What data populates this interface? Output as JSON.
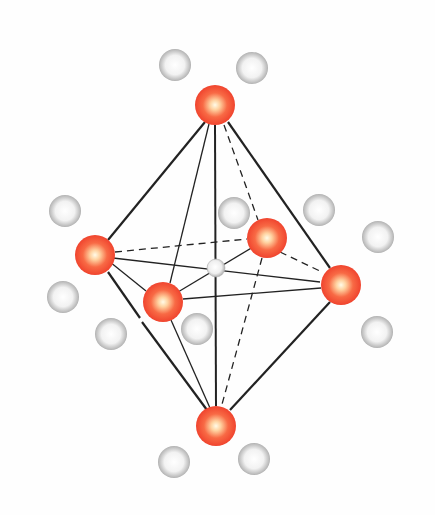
{
  "diagram": {
    "title": "",
    "type": "octahedral coordination",
    "colors": {
      "ligand": "#f04a30",
      "ligand_highlight": "#fff4e0",
      "center": "#d9d9d9",
      "neighbor": "#a8a8a8",
      "neighbor_highlight": "#ffffff",
      "edge": "#222222",
      "background": "#fefefe"
    },
    "center_atom": {
      "x": 216,
      "y": 268,
      "r": 9
    },
    "ligands": [
      {
        "id": "top",
        "x": 215,
        "y": 105,
        "r": 20
      },
      {
        "id": "left",
        "x": 95,
        "y": 255,
        "r": 20
      },
      {
        "id": "back-right",
        "x": 267,
        "y": 238,
        "r": 20
      },
      {
        "id": "front",
        "x": 163,
        "y": 302,
        "r": 20
      },
      {
        "id": "right",
        "x": 341,
        "y": 285,
        "r": 20
      },
      {
        "id": "bottom",
        "x": 216,
        "y": 426,
        "r": 20
      }
    ],
    "neighbors": [
      {
        "x": 175,
        "y": 65
      },
      {
        "x": 252,
        "y": 68
      },
      {
        "x": 65,
        "y": 211
      },
      {
        "x": 234,
        "y": 213
      },
      {
        "x": 319,
        "y": 210
      },
      {
        "x": 378,
        "y": 237
      },
      {
        "x": 63,
        "y": 297
      },
      {
        "x": 111,
        "y": 334
      },
      {
        "x": 197,
        "y": 329
      },
      {
        "x": 377,
        "y": 332
      },
      {
        "x": 174,
        "y": 462
      },
      {
        "x": 254,
        "y": 459
      }
    ],
    "neighbor_radius": 16
  }
}
